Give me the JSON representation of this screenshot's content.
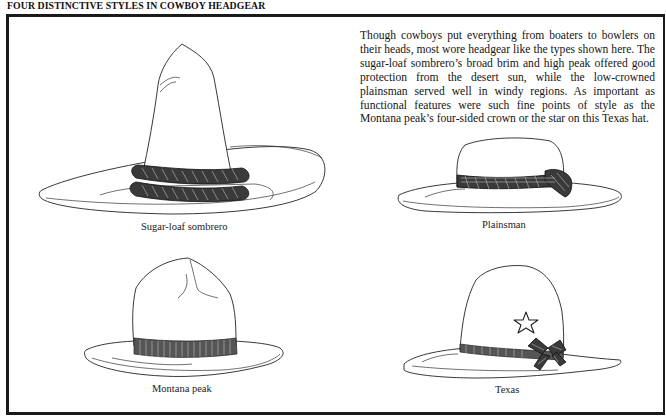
{
  "page": {
    "title": "FOUR DISTINCTIVE STYLES IN COWBOY HEADGEAR",
    "description": "Though cowboys put everything from boaters to bowlers on their heads, most wore headgear like the types shown here. The sugar-loaf sombrero’s broad brim and high peak offered good protection from the desert sun, while the low-crowned plainsman served well in windy regions. As important as functional features were such fine points of style as the Montana peak’s four-sided crown or the star on this Texas hat."
  },
  "hats": [
    {
      "id": "sugar-loaf-sombrero",
      "caption": "Sugar-loaf sombrero",
      "feature": "rope-band-icon"
    },
    {
      "id": "plainsman",
      "caption": "Plainsman",
      "feature": "woven-band-icon"
    },
    {
      "id": "montana-peak",
      "caption": "Montana peak",
      "feature": "ribbed-band-icon"
    },
    {
      "id": "texas",
      "caption": "Texas",
      "feature": "star-icon"
    }
  ],
  "colors": {
    "ink": "#1a1a1a",
    "paper": "#ffffff",
    "band": "#3a3a3a"
  }
}
